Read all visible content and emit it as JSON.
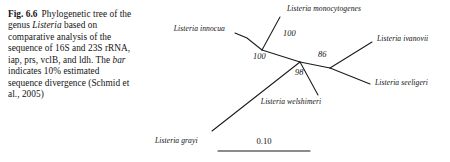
{
  "figure": {
    "number": "Fig. 6.6",
    "caption_parts": [
      {
        "text": "Phylogenetic tree of the genus ",
        "style": "normal"
      },
      {
        "text": "Listeria",
        "style": "italic"
      },
      {
        "text": " based on comparative analysis of the sequence of 16S and 23S rRNA, iap, prs, vclB, and ldh. The ",
        "style": "normal"
      },
      {
        "text": "bar",
        "style": "italic"
      },
      {
        "text": " indicates 10% estimated sequence divergence (Schmid et al., 2005)",
        "style": "normal"
      }
    ],
    "caption_plain": "Phylogenetic tree of the genus Listeria based on comparative analysis of the sequence of 16S and 23S rRNA, iap, prs, vclB, and ldh. The bar indicates 10% estimated sequence divergence (Schmid et al., 2005)"
  },
  "tree": {
    "type": "unrooted-phylogram",
    "line_color": "#1a1a1a",
    "taxa": [
      {
        "id": "monocytogenes",
        "label": "Listeria monocytogenes"
      },
      {
        "id": "innocua",
        "label": "Listeria innocua"
      },
      {
        "id": "ivanovii",
        "label": "Listeria ivanovii"
      },
      {
        "id": "seeligeri",
        "label": "Listeria seeligeri"
      },
      {
        "id": "welshimeri",
        "label": "Listeria welshimeri"
      },
      {
        "id": "grayi",
        "label": "Listeria grayi"
      }
    ],
    "bootstrap_values": [
      {
        "id": "boot-mono-inno",
        "label": "100"
      },
      {
        "id": "boot-grayi",
        "label": "100"
      },
      {
        "id": "boot-ivanovii",
        "label": "86"
      },
      {
        "id": "boot-welshimeri",
        "label": "98"
      }
    ],
    "scale_bar": {
      "label": "0.10",
      "meaning": "10% estimated sequence divergence"
    }
  }
}
